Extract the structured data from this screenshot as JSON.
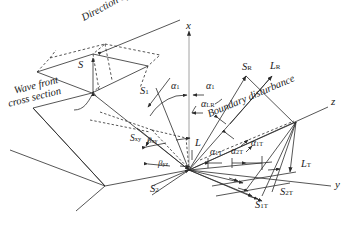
{
  "figure": {
    "type": "technical-diagram",
    "background": "#ffffff",
    "stroke": "#2b2b2b",
    "width": 354,
    "height": 230
  },
  "axes": [
    {
      "name": "x-axis",
      "label": "x",
      "x": 189,
      "y": 24,
      "direction": "up"
    },
    {
      "name": "y-axis",
      "label": "y",
      "x": 337,
      "y": 186,
      "direction": "lower-right"
    },
    {
      "name": "z-axis",
      "label": "z",
      "x": 334,
      "y": 103,
      "direction": "upper-right"
    }
  ],
  "annotations": [
    {
      "name": "direction-of-strain",
      "text": "Direction of strain",
      "x": 80,
      "y": 14,
      "rotate": -28,
      "italic": true
    },
    {
      "name": "wave-front-label-line1",
      "text": "Wave front",
      "x": 14,
      "y": 88,
      "rotate": -14,
      "italic": true
    },
    {
      "name": "wave-front-label-line2",
      "text": "cross section",
      "x": 10,
      "y": 99,
      "rotate": -14,
      "italic": true
    },
    {
      "name": "boundary-disturbance",
      "text": "Boundary disturbance",
      "x": 209,
      "y": 107,
      "rotate": -22,
      "italic": true
    }
  ],
  "vectors": [
    {
      "name": "S-incident-wavefront",
      "label": "S",
      "sub": "",
      "x": 78,
      "y": 64
    },
    {
      "name": "S1-incident",
      "label": "S",
      "sub": "1",
      "x": 143,
      "y": 91
    },
    {
      "name": "S2-incident",
      "label": "S",
      "sub": "2",
      "x": 153,
      "y": 189
    },
    {
      "name": "Sxy-component",
      "label": "S",
      "sub": "xy",
      "x": 135,
      "y": 140
    },
    {
      "name": "L-longitudinal",
      "label": "L",
      "sub": "",
      "x": 196,
      "y": 144
    },
    {
      "name": "SR-reflected-shear",
      "label": "S",
      "sub": "R",
      "x": 245,
      "y": 67
    },
    {
      "name": "LR-reflected-longitudinal",
      "label": "L",
      "sub": "R",
      "x": 272,
      "y": 66
    },
    {
      "name": "LT-transmitted-longitudinal",
      "label": "L",
      "sub": "T",
      "x": 303,
      "y": 164
    },
    {
      "name": "S2T-transmitted-shear-2",
      "label": "S",
      "sub": "2T",
      "x": 283,
      "y": 192
    },
    {
      "name": "S1T-transmitted-shear-1",
      "label": "S",
      "sub": "1T",
      "x": 258,
      "y": 205
    }
  ],
  "angles": [
    {
      "name": "alpha-1-left",
      "label": "α",
      "sub": "1",
      "x": 174,
      "y": 86
    },
    {
      "name": "alpha-1-right",
      "label": "α",
      "sub": "1",
      "x": 209,
      "y": 86
    },
    {
      "name": "alpha-LR",
      "label": "α",
      "sub": "LR",
      "x": 205,
      "y": 104
    },
    {
      "name": "alpha-1T-left",
      "label": "α",
      "sub": "1T",
      "x": 213,
      "y": 152
    },
    {
      "name": "alpha-2T",
      "label": "α",
      "sub": "2T",
      "x": 233,
      "y": 151
    },
    {
      "name": "alpha-1T-right",
      "label": "α",
      "sub": "1T",
      "x": 253,
      "y": 144
    },
    {
      "name": "beta-xy",
      "label": "β",
      "sub": "xy",
      "x": 150,
      "y": 141
    },
    {
      "name": "beta-yz",
      "label": "β",
      "sub": "yz",
      "x": 160,
      "y": 164
    }
  ]
}
